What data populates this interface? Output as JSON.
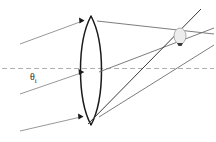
{
  "figure": {
    "kind": "optical-ray-diagram",
    "title": "",
    "background_color": "#ffffff",
    "width": 216,
    "height": 142
  },
  "labels": {
    "incidence_angle": {
      "symbol": "θ",
      "subscript": "i",
      "text": "θi",
      "color": "#2b2b2b",
      "x": 30,
      "y": 72
    }
  },
  "colors": {
    "lens_outline": "#1a1a1a",
    "incoming_ray": "#8c8c8c",
    "outgoing_ray": "#6e6e6e",
    "marginal_ray": "#3a3a3a",
    "optical_axis": "#b0b0b0",
    "arrowhead": "#1a1a1a",
    "focal_spot_fill": "#e9e9e9",
    "focal_spot_stroke": "#9a9a9a"
  },
  "elements": {
    "optical_axis": {
      "name": "optical-axis",
      "style": "dashed",
      "y": 68,
      "x_start": 2,
      "x_end": 214
    },
    "lens": {
      "name": "biconvex-lens",
      "center_x": 91,
      "top_y": 16,
      "bottom_y": 125,
      "left_edge_x": 83,
      "right_edge_x": 100,
      "bulge": 9
    },
    "focal_spot": {
      "name": "focal-spot-marker",
      "cx": 180,
      "cy": 36,
      "rx": 6,
      "ry": 8
    },
    "incoming_rays": [
      {
        "name": "incoming-ray-top",
        "x1": 20,
        "y1": 44,
        "x2": 84,
        "y2": 20
      },
      {
        "name": "incoming-ray-middle",
        "x1": 20,
        "y1": 95,
        "x2": 84,
        "y2": 72
      },
      {
        "name": "incoming-ray-bottom",
        "x1": 20,
        "y1": 130,
        "x2": 83,
        "y2": 116
      }
    ],
    "outgoing_rays": [
      {
        "name": "outgoing-ray-upper",
        "x1": 100,
        "y1": 21,
        "x2": 214,
        "y2": 34
      },
      {
        "name": "outgoing-ray-middle",
        "x1": 100,
        "y1": 72,
        "x2": 214,
        "y2": 30
      },
      {
        "name": "outgoing-ray-lower",
        "x1": 100,
        "y1": 117,
        "x2": 214,
        "y2": 44
      },
      {
        "name": "marginal-ray-steep",
        "x1": 88,
        "y1": 124,
        "x2": 200,
        "y2": 10
      }
    ],
    "arrowheads": [
      {
        "name": "arrowhead-top",
        "x": 83,
        "y": 20
      },
      {
        "name": "arrowhead-middle",
        "x": 83,
        "y": 72
      },
      {
        "name": "arrowhead-bottom",
        "x": 82,
        "y": 116
      },
      {
        "name": "arrowhead-focal-spot",
        "x": 180,
        "y": 46
      }
    ]
  }
}
